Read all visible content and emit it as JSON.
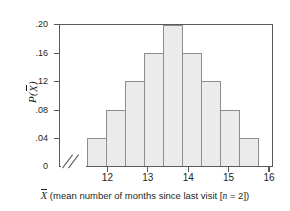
{
  "chart_data": {
    "type": "bar",
    "title": "",
    "subtitle": "",
    "xlabel_parts": {
      "symbol": "X",
      "text_before": " (mean number of months since last visit [",
      "n_symbol": "n",
      "text_after": " = 2])"
    },
    "xlabel": "X̄ (mean number of months since last visit [n = 2])",
    "ylabel": "P(X̄)",
    "ylabel_parts": {
      "p": "P",
      "open": "(",
      "symbol": "X",
      "close": ")"
    },
    "categories": [
      11.75,
      12.25,
      12.75,
      13.25,
      13.75,
      14.25,
      14.75,
      15.25,
      15.75
    ],
    "values": [
      0.04,
      0.08,
      0.12,
      0.16,
      0.2,
      0.16,
      0.12,
      0.08,
      0.04
    ],
    "bin_width": 0.5,
    "ylim": [
      0,
      0.2
    ],
    "xlim": [
      11.5,
      16.5
    ],
    "y_ticks": [
      0.2,
      0.16,
      0.12,
      0.08,
      0.04
    ],
    "y_ticklabels": [
      ".20",
      ".16",
      ".12",
      ".08",
      ".04"
    ],
    "y_zero_label": "0",
    "x_ticks": [
      12,
      13,
      14,
      15,
      16
    ],
    "x_ticklabels": [
      "12",
      "13",
      "14",
      "15",
      "16"
    ],
    "grid": false,
    "legend": "none",
    "axis_break": true,
    "colors": {
      "bar_fill": "#ebebeb",
      "bar_stroke": "#8b8d8f",
      "axis": "#58595b",
      "text": "#231f20",
      "background": "#ffffff"
    }
  }
}
